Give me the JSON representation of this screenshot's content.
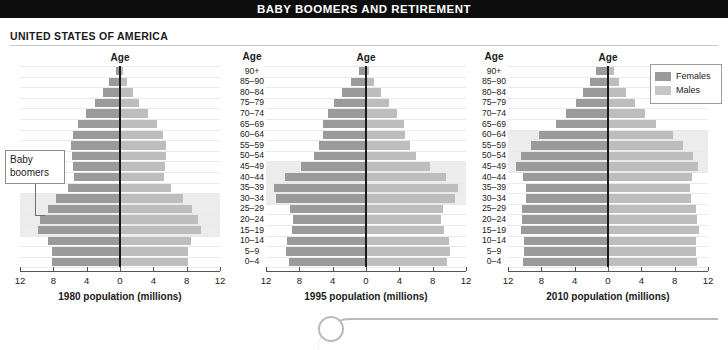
{
  "title": "BABY BOOMERS AND RETIREMENT",
  "country_heading": "UNITED STATES OF AMERICA",
  "age_header": "Age",
  "callout": {
    "line1": "Baby",
    "line2": "boomers"
  },
  "legend": {
    "females": "Females",
    "males": "Males"
  },
  "colors": {
    "title_bar_bg": "#0d0d0d",
    "title_bar_text": "#ffffff",
    "females": "#9a9a9a",
    "males": "#bdbdbd",
    "highlight_band": "#ececec",
    "gridline": "#e9e9e9",
    "axis": "#555555",
    "zero_line": "#1a1a1a"
  },
  "age_groups": [
    "90+",
    "85–90",
    "80–84",
    "75–79",
    "70–74",
    "65–69",
    "60–64",
    "55–59",
    "50–54",
    "45–49",
    "40–44",
    "35–39",
    "30–34",
    "25–29",
    "20–24",
    "15–19",
    "10–14",
    "5–9",
    "0–4"
  ],
  "tick_labels": [
    "12",
    "8",
    "4",
    "0",
    "4",
    "8",
    "12"
  ],
  "chart_data": [
    {
      "type": "bar",
      "title": "1980 population (millions)",
      "xlabel": "1980 population (millions)",
      "ylabel": "Age",
      "orientation": "population-pyramid",
      "xlim": [
        -12,
        12
      ],
      "grid": true,
      "legend_position": "none",
      "categories": [
        "90+",
        "85–90",
        "80–84",
        "75–79",
        "70–74",
        "65–69",
        "60–64",
        "55–59",
        "50–54",
        "45–49",
        "40–44",
        "35–39",
        "30–34",
        "25–29",
        "20–24",
        "15–19",
        "10–14",
        "5–9",
        "0–4"
      ],
      "series": [
        {
          "name": "Females",
          "side": "left",
          "values": [
            0.5,
            1.3,
            2.1,
            3.0,
            4.1,
            5.1,
            5.7,
            5.9,
            5.8,
            5.6,
            5.5,
            6.2,
            7.7,
            8.7,
            9.6,
            9.8,
            8.6,
            8.2,
            8.2
          ]
        },
        {
          "name": "Males",
          "side": "right",
          "values": [
            0.3,
            0.8,
            1.5,
            2.3,
            3.3,
            4.4,
            5.1,
            5.5,
            5.5,
            5.4,
            5.3,
            6.1,
            7.6,
            8.6,
            9.4,
            9.7,
            8.5,
            8.2,
            8.2
          ]
        }
      ],
      "highlight": {
        "label": "Baby boomers",
        "groups": [
          "30–34",
          "25–29",
          "20–24",
          "15–19"
        ]
      }
    },
    {
      "type": "bar",
      "title": "1995 population (millions)",
      "xlabel": "1995 population (millions)",
      "ylabel": "Age",
      "orientation": "population-pyramid",
      "xlim": [
        -12,
        12
      ],
      "grid": true,
      "legend_position": "none",
      "categories": [
        "90+",
        "85–90",
        "80–84",
        "75–79",
        "70–74",
        "65–69",
        "60–64",
        "55–59",
        "50–54",
        "45–49",
        "40–44",
        "35–39",
        "30–34",
        "25–29",
        "20–24",
        "15–19",
        "10–14",
        "5–9",
        "0–4"
      ],
      "series": [
        {
          "name": "Females",
          "side": "left",
          "values": [
            0.8,
            1.8,
            2.9,
            3.8,
            4.6,
            5.2,
            5.2,
            5.6,
            6.2,
            7.8,
            9.7,
            11.1,
            10.8,
            9.1,
            8.8,
            8.9,
            9.5,
            9.6,
            9.2
          ]
        },
        {
          "name": "Males",
          "side": "right",
          "values": [
            0.4,
            1.0,
            1.8,
            2.7,
            3.7,
            4.5,
            4.7,
            5.3,
            6.0,
            7.7,
            9.6,
            11.0,
            10.7,
            9.2,
            9.0,
            9.3,
            10.0,
            10.1,
            9.7
          ]
        }
      ],
      "highlight": {
        "label": "Baby boomers",
        "groups": [
          "45–49",
          "40–44",
          "35–39",
          "30–34"
        ]
      }
    },
    {
      "type": "bar",
      "title": "2010 population (millions)",
      "xlabel": "2010 population (millions)",
      "ylabel": "Age",
      "orientation": "population-pyramid",
      "xlim": [
        -12,
        12
      ],
      "grid": true,
      "legend_position": "top-right",
      "categories": [
        "90+",
        "85–90",
        "80–84",
        "75–79",
        "70–74",
        "65–69",
        "60–64",
        "55–59",
        "50–54",
        "45–49",
        "40–44",
        "35–39",
        "30–34",
        "25–29",
        "20–24",
        "15–19",
        "10–14",
        "5–9",
        "0–4"
      ],
      "series": [
        {
          "name": "Females",
          "side": "left",
          "values": [
            1.4,
            2.2,
            3.0,
            3.9,
            5.0,
            6.3,
            8.3,
            9.3,
            10.4,
            11.0,
            10.2,
            9.8,
            9.8,
            10.3,
            10.3,
            10.4,
            10.1,
            10.1,
            10.2
          ]
        },
        {
          "name": "Males",
          "side": "right",
          "values": [
            0.7,
            1.3,
            2.1,
            3.2,
            4.4,
            5.8,
            7.8,
            9.0,
            10.2,
            10.8,
            10.1,
            9.8,
            9.9,
            10.6,
            10.7,
            10.9,
            10.6,
            10.6,
            10.7
          ]
        }
      ],
      "highlight": {
        "label": "Baby boomers",
        "groups": [
          "60–64",
          "55–59",
          "50–54",
          "45–49"
        ]
      }
    }
  ]
}
